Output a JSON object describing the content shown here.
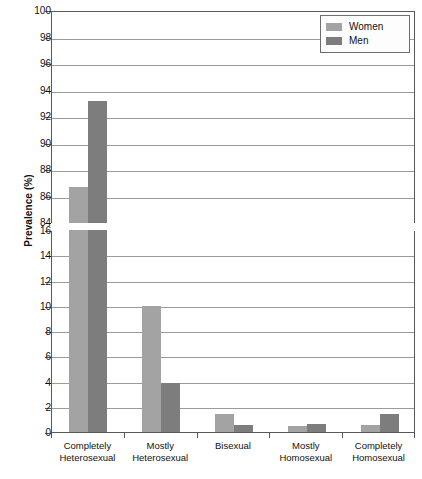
{
  "chart_data": {
    "type": "bar",
    "title": "",
    "subtitle": "",
    "xlabel": "",
    "ylabel": "Prevalence (%)",
    "grid": true,
    "legend_position": "top-right",
    "broken_axis": true,
    "categories": [
      "Completely Heterosexual",
      "Mostly Heterosexual",
      "Bisexual",
      "Mostly Homosexual",
      "Completely Homosexual"
    ],
    "category_lines": [
      [
        "Completely",
        "Heterosexual"
      ],
      [
        "Mostly",
        "Heterosexual"
      ],
      [
        "Bisexual",
        ""
      ],
      [
        "Mostly",
        "Homosexual"
      ],
      [
        "Completely",
        "Homosexual"
      ]
    ],
    "series": [
      {
        "name": "Women",
        "color": "#a3a3a3",
        "values": [
          86.7,
          10.0,
          1.4,
          0.45,
          0.55
        ]
      },
      {
        "name": "Men",
        "color": "#7d7d7d",
        "values": [
          93.2,
          3.85,
          0.55,
          0.65,
          1.4
        ]
      }
    ],
    "panels": [
      {
        "name": "upper",
        "ylim": [
          84,
          100
        ],
        "yticks": [
          84,
          86,
          88,
          90,
          92,
          94,
          96,
          98,
          100
        ],
        "ytick_labels": [
          "84",
          "86",
          "88",
          "90",
          "92",
          "94",
          "96",
          "98",
          "100"
        ]
      },
      {
        "name": "lower",
        "ylim": [
          0,
          16
        ],
        "yticks": [
          0,
          2,
          4,
          6,
          8,
          10,
          12,
          14,
          16
        ],
        "ytick_labels": [
          "0",
          "2",
          "4",
          "6",
          "8",
          "10",
          "12",
          "14",
          "16"
        ]
      }
    ]
  },
  "legend": {
    "items": [
      {
        "label": "Women",
        "color": "#a3a3a3"
      },
      {
        "label": "Men",
        "color": "#7d7d7d"
      }
    ]
  },
  "axis": {
    "y_title": "Prevalence (%)"
  }
}
